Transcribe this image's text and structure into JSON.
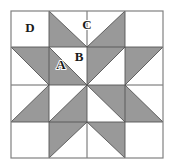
{
  "figure": {
    "kind": "geometric-quilt-block"
  },
  "colors": {
    "shaded": "#999999",
    "background": "#ffffff",
    "line": "#555555",
    "outer_border": "#808080",
    "label": "#1a1a1a"
  },
  "geometry": {
    "block_left": 11,
    "block_top": 11,
    "block_right": 163,
    "block_bottom": 158,
    "grid_columns": 4,
    "grid_rows": 4,
    "x_lines": [
      11,
      49,
      87,
      125,
      163
    ],
    "y_lines": [
      11,
      47,
      85,
      122,
      158
    ],
    "center_x": 87,
    "center_y": 85
  },
  "labels": [
    {
      "text": "D",
      "x": 30,
      "y": 29,
      "describes": "plain-corner-square"
    },
    {
      "text": "C",
      "x": 87,
      "y": 26,
      "describes": "large-white-triangle-top"
    },
    {
      "text": "A",
      "x": 61,
      "y": 66,
      "describes": "small-white-triangle-inner"
    },
    {
      "text": "B",
      "x": 79,
      "y": 58,
      "describes": "small-white-triangle-upper"
    }
  ],
  "shapes": {
    "outer_frame": {
      "x": 11,
      "y": 11,
      "width": 152,
      "height": 147
    },
    "shaded_polygons": [
      {
        "name": "top-left-star-flank",
        "points": "49,11 87,47 49,47"
      },
      {
        "name": "top-right-star-flank",
        "points": "125,11 125,47 87,47"
      },
      {
        "name": "left-top-star-flank",
        "points": "11,47 49,47 49,85"
      },
      {
        "name": "left-bottom-star-flank",
        "points": "11,122 49,85 49,122"
      },
      {
        "name": "right-top-star-flank",
        "points": "163,47 125,85 125,47"
      },
      {
        "name": "right-bottom-star-flank",
        "points": "163,122 125,122 125,85"
      },
      {
        "name": "bottom-left-star-flank",
        "points": "49,158 49,122 87,122"
      },
      {
        "name": "bottom-right-star-flank",
        "points": "125,158 87,122 125,122"
      },
      {
        "name": "pinwheel-blade-nw",
        "points": "49,85 87,85 49,47"
      },
      {
        "name": "pinwheel-blade-ne",
        "points": "87,47 125,47 87,85"
      },
      {
        "name": "pinwheel-blade-se",
        "points": "125,85 125,122 87,85"
      },
      {
        "name": "pinwheel-blade-sw",
        "points": "87,122 49,122 87,85"
      }
    ],
    "division_lines": [
      {
        "name": "grid-v1",
        "x1": 49,
        "y1": 11,
        "x2": 49,
        "y2": 158
      },
      {
        "name": "grid-v2",
        "x1": 87,
        "y1": 11,
        "x2": 87,
        "y2": 158
      },
      {
        "name": "grid-v3",
        "x1": 125,
        "y1": 11,
        "x2": 125,
        "y2": 158
      },
      {
        "name": "grid-h1",
        "x1": 11,
        "y1": 47,
        "x2": 163,
        "y2": 47
      },
      {
        "name": "grid-h2",
        "x1": 11,
        "y1": 85,
        "x2": 163,
        "y2": 85
      },
      {
        "name": "grid-h3",
        "x1": 11,
        "y1": 122,
        "x2": 163,
        "y2": 122
      },
      {
        "name": "diag-top-left-point",
        "x1": 49,
        "y1": 11,
        "x2": 87,
        "y2": 47
      },
      {
        "name": "diag-top-right-point",
        "x1": 125,
        "y1": 11,
        "x2": 87,
        "y2": 47
      },
      {
        "name": "diag-left-upper-point",
        "x1": 11,
        "y1": 47,
        "x2": 49,
        "y2": 85
      },
      {
        "name": "diag-left-lower-point",
        "x1": 11,
        "y1": 122,
        "x2": 49,
        "y2": 85
      },
      {
        "name": "diag-right-upper-point",
        "x1": 163,
        "y1": 47,
        "x2": 125,
        "y2": 85
      },
      {
        "name": "diag-right-lower-point",
        "x1": 163,
        "y1": 122,
        "x2": 125,
        "y2": 85
      },
      {
        "name": "diag-bottom-left-point",
        "x1": 49,
        "y1": 158,
        "x2": 87,
        "y2": 122
      },
      {
        "name": "diag-bottom-right-point",
        "x1": 125,
        "y1": 158,
        "x2": 87,
        "y2": 122
      },
      {
        "name": "diag-center-nw",
        "x1": 49,
        "y1": 47,
        "x2": 87,
        "y2": 85
      },
      {
        "name": "diag-center-ne",
        "x1": 125,
        "y1": 47,
        "x2": 87,
        "y2": 85
      },
      {
        "name": "diag-center-sw",
        "x1": 49,
        "y1": 122,
        "x2": 87,
        "y2": 85
      },
      {
        "name": "diag-center-se",
        "x1": 125,
        "y1": 122,
        "x2": 87,
        "y2": 85
      }
    ]
  }
}
